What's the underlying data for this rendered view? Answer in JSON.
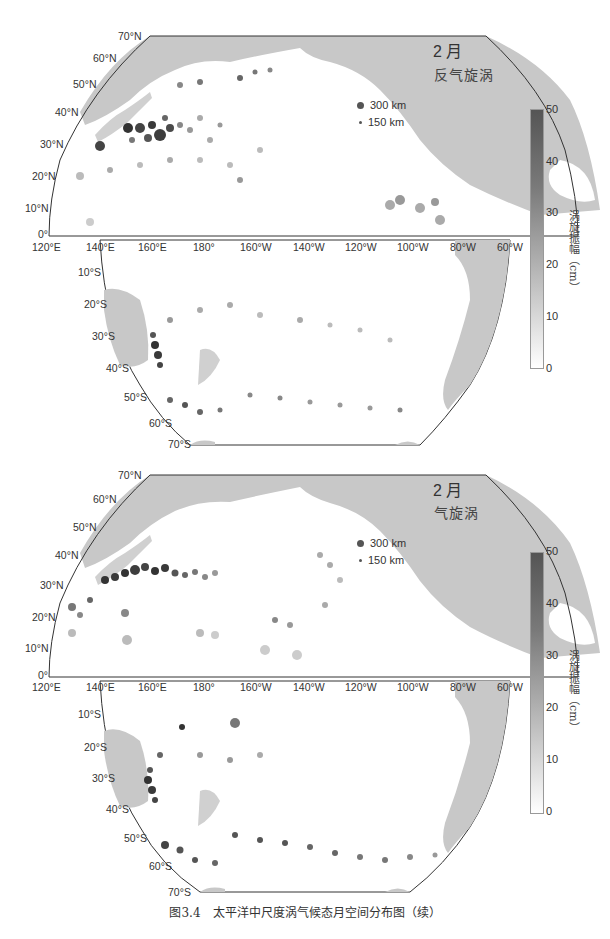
{
  "figure": {
    "caption": "图3.4　太平洋中尺度涡气候态月空间分布图（续）"
  },
  "panels": [
    {
      "month": "2 月",
      "eddy_type": "反气旋涡",
      "legend": [
        {
          "label": "300 km",
          "size": 8
        },
        {
          "label": "150 km",
          "size": 4
        }
      ],
      "colorbar": {
        "title": "涡旋振幅（cm）",
        "ticks": [
          "50",
          "40",
          "30",
          "20",
          "10",
          "0"
        ],
        "range": [
          0,
          50
        ]
      }
    },
    {
      "month": "2 月",
      "eddy_type": "气旋涡",
      "legend": [
        {
          "label": "300 km",
          "size": 8
        },
        {
          "label": "150 km",
          "size": 4
        }
      ],
      "colorbar": {
        "title": "涡旋振幅（cm）",
        "ticks": [
          "50",
          "40",
          "30",
          "20",
          "10",
          "0"
        ],
        "range": [
          0,
          50
        ]
      }
    }
  ],
  "axes": {
    "north_lat_labels": [
      "70°N",
      "60°N",
      "50°N",
      "40°N",
      "30°N",
      "20°N",
      "10°N",
      "0°"
    ],
    "south_lat_labels": [
      "10°S",
      "20°S",
      "30°S",
      "40°S",
      "50°S",
      "60°S",
      "70°S"
    ],
    "lon_labels": [
      "120°E",
      "140°E",
      "160°E",
      "180°",
      "160°W",
      "140°W",
      "120°W",
      "100°W",
      "80°W",
      "60°W"
    ]
  },
  "colors": {
    "land": "#c8c8c8",
    "ocean": "#ffffff",
    "frame": "#333333",
    "eddy_high": "#3a3a3a",
    "eddy_low": "#d6d6d6"
  }
}
